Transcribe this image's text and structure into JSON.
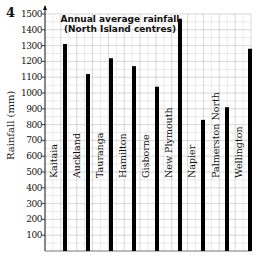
{
  "question_number": "4",
  "chart_data": {
    "type": "bar",
    "title": "Annual average rainfall (North Island centres)",
    "title_lines": [
      "Annual average rainfall",
      "(North Island centres)"
    ],
    "xlabel": "",
    "ylabel": "Rainfall (mm)",
    "ylim": [
      0,
      1500
    ],
    "yticks": [
      100,
      200,
      300,
      400,
      500,
      600,
      700,
      800,
      900,
      1000,
      1100,
      1200,
      1300,
      1400,
      1500
    ],
    "grid": true,
    "legend": "none",
    "categories": [
      "Kaitaia",
      "Auckland",
      "Tauranga",
      "Hamilton",
      "Gisborne",
      "New Plymouth",
      "Napier",
      "Palmerston North",
      "Wellington"
    ],
    "values": [
      1310,
      1120,
      1220,
      1170,
      1040,
      1470,
      830,
      910,
      1280
    ],
    "bar_color": "#000000"
  }
}
